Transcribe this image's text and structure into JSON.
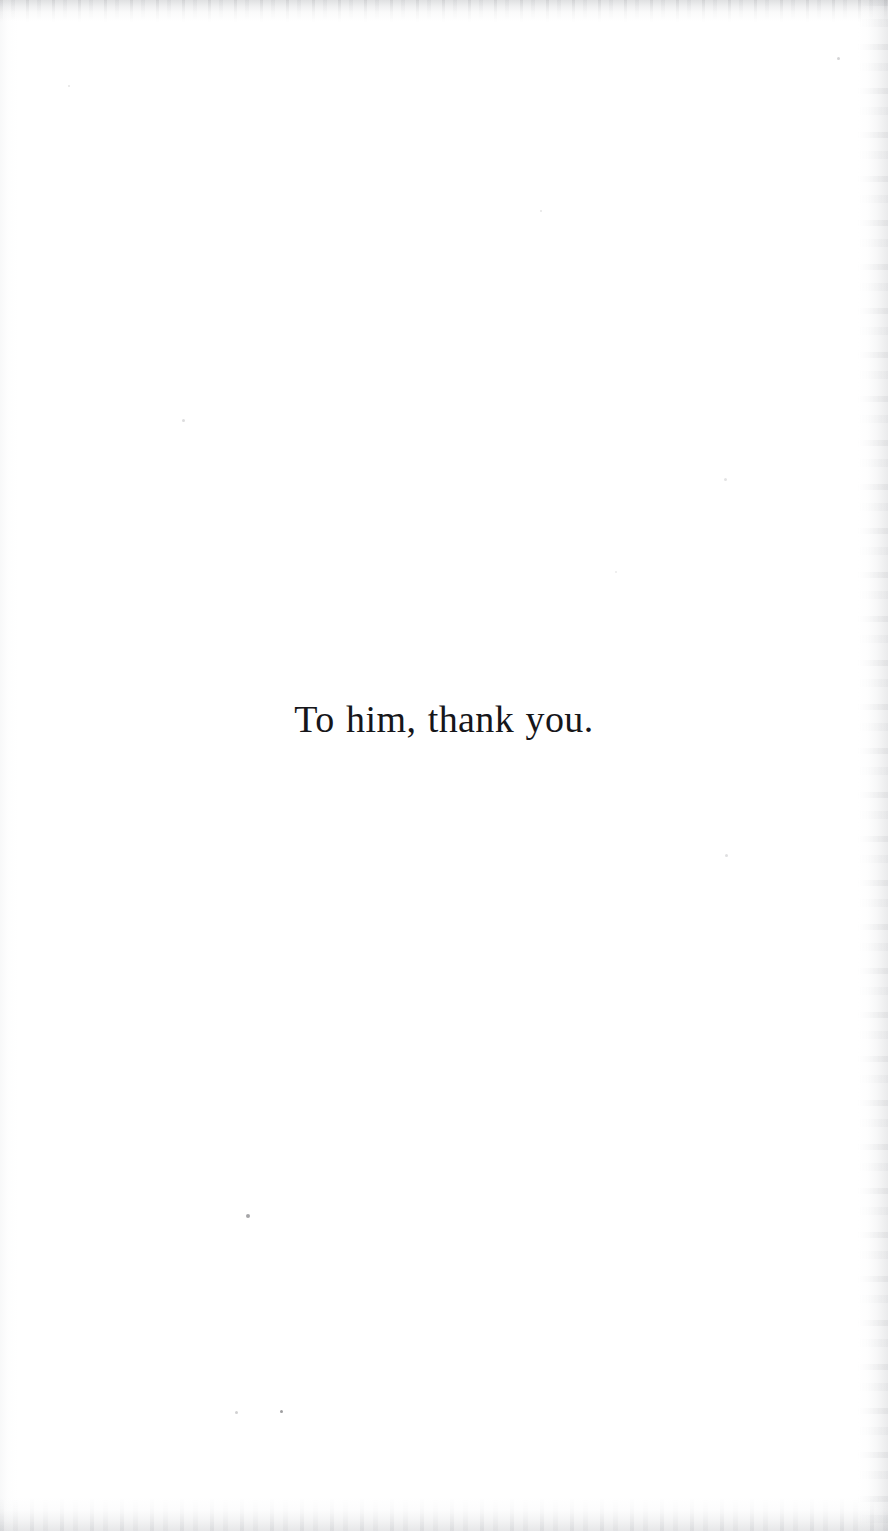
{
  "page": {
    "kind": "book-dedication-page",
    "width": 888,
    "height": 1531,
    "background_color": "#ffffff"
  },
  "dedication": {
    "text": "To him, thank you.",
    "text_color": "#16161a",
    "alignment": "center"
  },
  "scan_artifacts": {
    "top_edge_color": "#9a9ca0",
    "bottom_edge_color": "#9ea0a5",
    "right_edge_color": "#a8aaaf",
    "left_edge_color": "#cdcfd3",
    "specks": [
      {
        "x": 183,
        "y": 420,
        "size": 3,
        "opacity": 0.16
      },
      {
        "x": 725,
        "y": 479,
        "size": 3,
        "opacity": 0.13
      },
      {
        "x": 726,
        "y": 855,
        "size": 3,
        "opacity": 0.15
      },
      {
        "x": 541,
        "y": 211,
        "size": 2,
        "opacity": 0.12
      },
      {
        "x": 616,
        "y": 572,
        "size": 2,
        "opacity": 0.1
      },
      {
        "x": 248,
        "y": 1216,
        "size": 4,
        "opacity": 0.42
      },
      {
        "x": 236,
        "y": 1412,
        "size": 3,
        "opacity": 0.22
      },
      {
        "x": 281,
        "y": 1411,
        "size": 3,
        "opacity": 0.45
      },
      {
        "x": 838,
        "y": 58,
        "size": 3,
        "opacity": 0.2
      },
      {
        "x": 69,
        "y": 86,
        "size": 2,
        "opacity": 0.12
      }
    ]
  }
}
